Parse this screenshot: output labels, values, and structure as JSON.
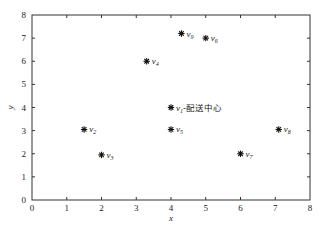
{
  "chart_data": {
    "type": "scatter",
    "title": "",
    "xlabel": "x",
    "ylabel": "y",
    "xlim": [
      0,
      8
    ],
    "ylim": [
      0,
      8
    ],
    "xticks": [
      0,
      1,
      2,
      3,
      4,
      5,
      6,
      7,
      8
    ],
    "yticks": [
      0,
      1,
      2,
      3,
      4,
      5,
      6,
      7,
      8
    ],
    "grid": false,
    "marker": "asterisk",
    "points": [
      {
        "id": "v1",
        "base": "v",
        "sub": "1",
        "suffix": "-配送中心",
        "x": 4.0,
        "y": 4.0
      },
      {
        "id": "v2",
        "base": "v",
        "sub": "2",
        "suffix": "",
        "x": 1.5,
        "y": 3.05
      },
      {
        "id": "v3",
        "base": "v",
        "sub": "3",
        "suffix": "",
        "x": 2.0,
        "y": 1.95
      },
      {
        "id": "v4",
        "base": "v",
        "sub": "4",
        "suffix": "",
        "x": 3.3,
        "y": 6.0
      },
      {
        "id": "v5",
        "base": "v",
        "sub": "5",
        "suffix": "",
        "x": 4.0,
        "y": 3.05
      },
      {
        "id": "v6",
        "base": "v",
        "sub": "6",
        "suffix": "",
        "x": 5.0,
        "y": 7.0
      },
      {
        "id": "v7",
        "base": "v",
        "sub": "7",
        "suffix": "",
        "x": 6.0,
        "y": 2.0
      },
      {
        "id": "v8",
        "base": "v",
        "sub": "8",
        "suffix": "",
        "x": 7.1,
        "y": 3.05
      },
      {
        "id": "v9",
        "base": "v",
        "sub": "9",
        "suffix": "",
        "x": 4.3,
        "y": 7.2
      }
    ]
  }
}
